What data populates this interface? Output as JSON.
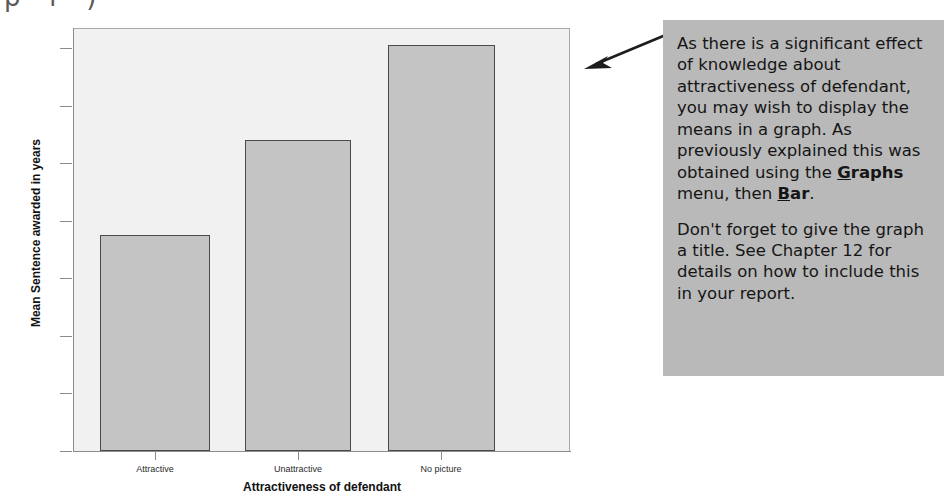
{
  "chart_data": {
    "type": "bar",
    "title": "",
    "xlabel": "Attractiveness of defendant",
    "ylabel": "Mean Sentence awarded in years",
    "categories": [
      "Attractive",
      "Unattractive",
      "No picture"
    ],
    "values": [
      7.5,
      10.8,
      14.1
    ],
    "ylim": [
      0,
      14.7
    ],
    "yticks": [
      0,
      2,
      4,
      6,
      8,
      10,
      12,
      14
    ],
    "ytick_labels": [
      "0",
      "2",
      "4",
      "6",
      "8",
      "10",
      "12",
      "14"
    ],
    "grid": false,
    "legend": "none",
    "bar_fill_color": "#c4c4c4",
    "bar_edge_color": "#4a4a4a",
    "plot_background_color": "#f1f1f1"
  },
  "annotation": {
    "background_color": "#b9b9b9",
    "paragraphs": [
      {
        "id": "p1",
        "runs": [
          {
            "text": "As there is a significant effect of knowledge about attractiveness of defendant, you may wish to display the means in a graph. As previously explained this was obtained using the ",
            "style": "normal"
          },
          {
            "text": "G",
            "style": "bold-underline"
          },
          {
            "text": "raphs",
            "style": "bold"
          },
          {
            "text": " menu, then ",
            "style": "normal"
          },
          {
            "text": "B",
            "style": "bold-underline"
          },
          {
            "text": "ar",
            "style": "bold"
          },
          {
            "text": ".",
            "style": "normal"
          }
        ]
      },
      {
        "id": "p2",
        "runs": [
          {
            "text": "Don't forget to give the graph a title. See Chapter 12 for details on how to include this in your report.",
            "style": "normal"
          }
        ]
      }
    ]
  },
  "pointer": {
    "name": "leftward-arrow",
    "direction": "left",
    "color": "#1d1d1d"
  },
  "top_sliver": {
    "text": "p     f        )"
  }
}
